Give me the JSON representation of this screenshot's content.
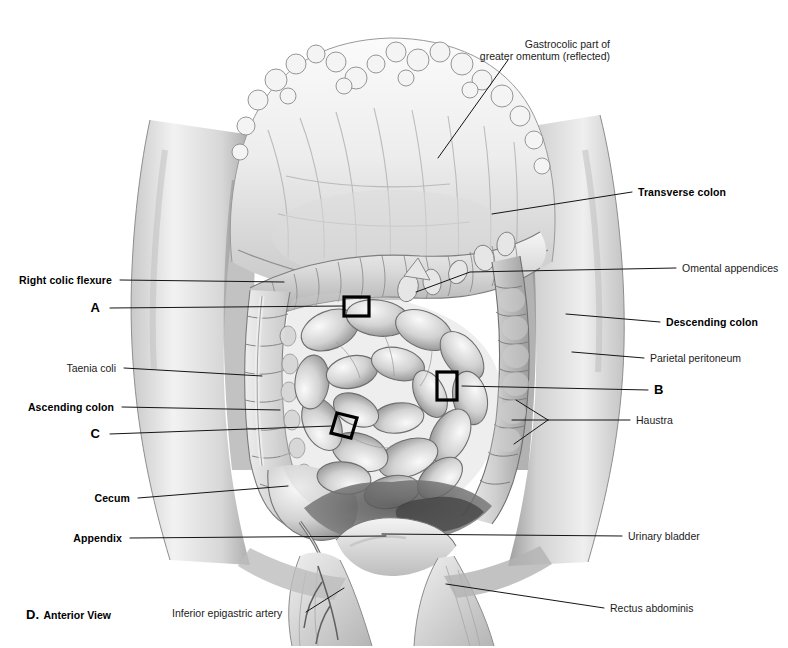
{
  "figure": {
    "caption_letter": "D.",
    "caption_text": "Anterior View",
    "view": "Anterior View",
    "background_color": "#ffffff",
    "ink_color": "#101010",
    "style": "grayscale medical illustration"
  },
  "labels": {
    "gastrocolic": {
      "line1": "Gastrocolic part of",
      "line2": "greater omentum (reflected)",
      "weight": "thin",
      "side": "right"
    },
    "transverse_colon": {
      "text": "Transverse colon",
      "weight": "bold",
      "side": "right"
    },
    "omental_appendices": {
      "text": "Omental appendices",
      "weight": "thin",
      "side": "right"
    },
    "descending_colon": {
      "text": "Descending colon",
      "weight": "bold",
      "side": "right"
    },
    "parietal_peritoneum": {
      "text": "Parietal peritoneum",
      "weight": "thin",
      "side": "right"
    },
    "marker_b": {
      "text": "B",
      "weight": "bold",
      "side": "right"
    },
    "haustra": {
      "text": "Haustra",
      "weight": "thin",
      "side": "right"
    },
    "urinary_bladder": {
      "text": "Urinary bladder",
      "weight": "thin",
      "side": "right"
    },
    "rectus_abdominis": {
      "text": "Rectus abdominis",
      "weight": "thin",
      "side": "right"
    },
    "right_colic_flexure": {
      "text": "Right colic flexure",
      "weight": "bold",
      "side": "left"
    },
    "marker_a": {
      "text": "A",
      "weight": "bold",
      "side": "left"
    },
    "taenia_coli": {
      "text": "Taenia coli",
      "weight": "thin",
      "side": "left"
    },
    "ascending_colon": {
      "text": "Ascending colon",
      "weight": "bold",
      "side": "left"
    },
    "marker_c": {
      "text": "C",
      "weight": "bold",
      "side": "left"
    },
    "cecum": {
      "text": "Cecum",
      "weight": "bold",
      "side": "left"
    },
    "appendix": {
      "text": "Appendix",
      "weight": "bold",
      "side": "left"
    },
    "inferior_epigastric_artery": {
      "text": "Inferior epigastric artery",
      "weight": "thin",
      "side": "bottom"
    }
  },
  "markers": [
    {
      "id": "A",
      "shape": "rectangle",
      "x": 344,
      "y": 297,
      "w": 25,
      "h": 19
    },
    {
      "id": "B",
      "shape": "rectangle",
      "x": 437,
      "y": 372,
      "w": 20,
      "h": 28
    },
    {
      "id": "C",
      "shape": "parallelogram",
      "x": 331,
      "y": 413,
      "w": 26,
      "h": 25
    }
  ]
}
